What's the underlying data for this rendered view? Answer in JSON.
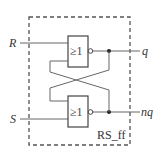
{
  "diagram": {
    "type": "logic-circuit",
    "component_name": "RS_ff",
    "inputs": [
      {
        "id": "R",
        "label": "R"
      },
      {
        "id": "S",
        "label": "S"
      }
    ],
    "outputs": [
      {
        "id": "q",
        "label": "q"
      },
      {
        "id": "nq",
        "label": "nq"
      }
    ],
    "gates": [
      {
        "id": "gate-top",
        "symbol": "≥1",
        "type": "NOR",
        "inputs": [
          "R",
          "nq"
        ],
        "output": "q"
      },
      {
        "id": "gate-bottom",
        "symbol": "≥1",
        "type": "NOR",
        "inputs": [
          "q",
          "S"
        ],
        "output": "nq"
      }
    ],
    "colors": {
      "line": "#555555",
      "gate_border": "#444444",
      "dashed_box": "#555555"
    }
  }
}
